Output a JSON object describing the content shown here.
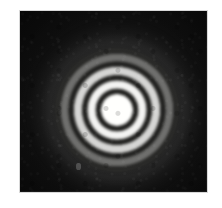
{
  "figure": {
    "caption": "",
    "kind": "photographic-plate",
    "page_background": "#ffffff",
    "plate": {
      "left": 20,
      "top": 11,
      "width": 187,
      "height": 181,
      "background_color": "#121212",
      "border_color": "#d8d8d8"
    },
    "pattern": {
      "center_x": 97,
      "center_y": 99,
      "center_x_page": 117,
      "center_y_page": 110,
      "ring_count": 4,
      "bright_core_radius": 16,
      "outer_visible_radius": 62
    },
    "defect": {
      "left": 56,
      "top": 152,
      "label": "emulsion-speck"
    },
    "colors": {
      "fringe_bright": "#f2f2ee",
      "fringe_dark": "#0b0b0b",
      "plate_base": "#161616",
      "paper": "#ffffff"
    },
    "fringes": [
      {
        "name": "central-maximum",
        "inner_pct": 0,
        "outer_pct": 25,
        "intensity": 1.0
      },
      {
        "name": "first-minimum",
        "inner_pct": 26,
        "outer_pct": 34,
        "intensity": 0.02
      },
      {
        "name": "first-maximum",
        "inner_pct": 35,
        "outer_pct": 47,
        "intensity": 0.95
      },
      {
        "name": "second-minimum",
        "inner_pct": 48,
        "outer_pct": 56,
        "intensity": 0.03
      },
      {
        "name": "second-maximum",
        "inner_pct": 57,
        "outer_pct": 69,
        "intensity": 0.82
      },
      {
        "name": "third-minimum",
        "inner_pct": 70,
        "outer_pct": 78,
        "intensity": 0.04
      },
      {
        "name": "third-maximum",
        "inner_pct": 79,
        "outer_pct": 90,
        "intensity": 0.38
      },
      {
        "name": "fourth-minimum",
        "inner_pct": 91,
        "outer_pct": 100,
        "intensity": 0.05
      }
    ]
  },
  "chart_data": {
    "type": "heatmap",
    "title": "",
    "xlabel": "",
    "ylabel": "",
    "radial_axis_unit": "pixels from center",
    "x": [
      0,
      8,
      16,
      18,
      21,
      25,
      29,
      32,
      35,
      39,
      43,
      47,
      50,
      54,
      58,
      62,
      68,
      75,
      85
    ],
    "values": [
      1.0,
      1.0,
      0.97,
      0.55,
      0.04,
      0.62,
      0.95,
      0.92,
      0.3,
      0.03,
      0.55,
      0.88,
      0.7,
      0.06,
      0.3,
      0.38,
      0.12,
      0.05,
      0.03
    ],
    "series": [
      {
        "name": "normalized intensity",
        "values": [
          1.0,
          1.0,
          0.97,
          0.55,
          0.04,
          0.62,
          0.95,
          0.92,
          0.3,
          0.03,
          0.55,
          0.88,
          0.7,
          0.06,
          0.3,
          0.38,
          0.12,
          0.05,
          0.03
        ]
      }
    ],
    "ylim": [
      0,
      1
    ],
    "grid": false,
    "legend": "none"
  }
}
